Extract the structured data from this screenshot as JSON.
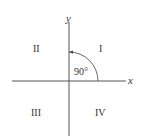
{
  "diagram": {
    "axes": {
      "x_label": "x",
      "y_label": "y"
    },
    "quadrants": [
      {
        "id": "I",
        "label": "I"
      },
      {
        "id": "II",
        "label": "II"
      },
      {
        "id": "III",
        "label": "III"
      },
      {
        "id": "IV",
        "label": "IV"
      }
    ],
    "angle": {
      "label": "90°",
      "from": "positive x-axis",
      "to": "positive y-axis",
      "direction": "counterclockwise"
    },
    "colors": {
      "line": "#444444",
      "text": "#333333"
    }
  }
}
